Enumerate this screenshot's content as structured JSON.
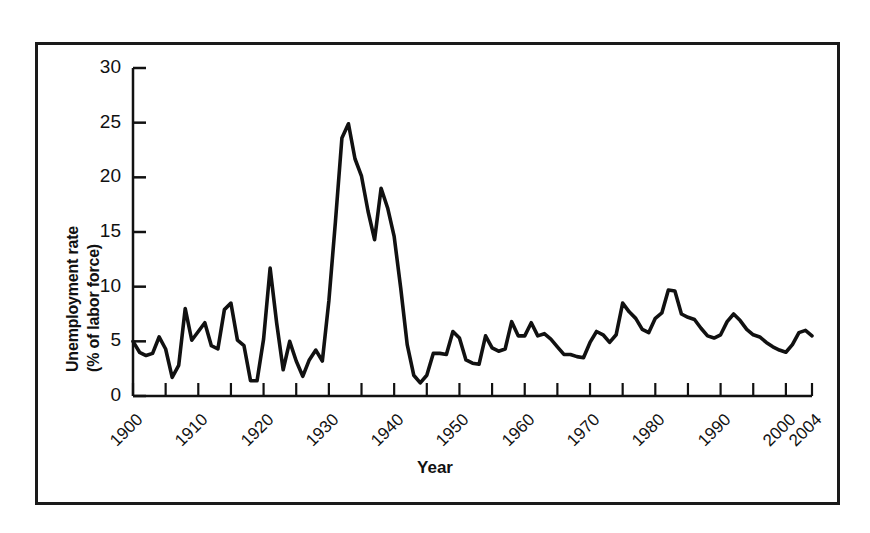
{
  "chart_data": {
    "type": "line",
    "title": "",
    "xlabel": "Year",
    "ylabel": "Unemployment rate (% of labor force)",
    "ylabel_line1": "Unemployment rate",
    "ylabel_line2": "(% of labor force)",
    "ylim": [
      0,
      30
    ],
    "xlim": [
      1900,
      2004
    ],
    "grid": false,
    "legend": "none",
    "ytick_labels": [
      "30",
      "25",
      "20",
      "15",
      "10",
      "5",
      "0"
    ],
    "ytick_values": [
      30,
      25,
      20,
      15,
      10,
      5,
      0
    ],
    "xtick_labels": [
      "1900",
      "1910",
      "1920",
      "1930",
      "1940",
      "1950",
      "1960",
      "1970",
      "1980",
      "1990",
      "2000",
      "2004"
    ],
    "xtick_values": [
      1900,
      1910,
      1920,
      1930,
      1940,
      1950,
      1960,
      1970,
      1980,
      1990,
      2000,
      2004
    ],
    "minor_xtick_interval": 5,
    "series": [
      {
        "name": "Unemployment rate",
        "color": "#111111",
        "x": [
          1900,
          1901,
          1902,
          1903,
          1904,
          1905,
          1906,
          1907,
          1908,
          1909,
          1910,
          1911,
          1912,
          1913,
          1914,
          1915,
          1916,
          1917,
          1918,
          1919,
          1920,
          1921,
          1922,
          1923,
          1924,
          1925,
          1926,
          1927,
          1928,
          1929,
          1930,
          1931,
          1932,
          1933,
          1934,
          1935,
          1936,
          1937,
          1938,
          1939,
          1940,
          1941,
          1942,
          1943,
          1944,
          1945,
          1946,
          1947,
          1948,
          1949,
          1950,
          1951,
          1952,
          1953,
          1954,
          1955,
          1956,
          1957,
          1958,
          1959,
          1960,
          1961,
          1962,
          1963,
          1964,
          1965,
          1966,
          1967,
          1968,
          1969,
          1970,
          1971,
          1972,
          1973,
          1974,
          1975,
          1976,
          1977,
          1978,
          1979,
          1980,
          1981,
          1982,
          1983,
          1984,
          1985,
          1986,
          1987,
          1988,
          1989,
          1990,
          1991,
          1992,
          1993,
          1994,
          1995,
          1996,
          1997,
          1998,
          1999,
          2000,
          2001,
          2002,
          2003,
          2004
        ],
        "values": [
          5.0,
          4.0,
          3.7,
          3.9,
          5.4,
          4.3,
          1.7,
          2.8,
          8.0,
          5.1,
          5.9,
          6.7,
          4.6,
          4.3,
          7.9,
          8.5,
          5.1,
          4.6,
          1.4,
          1.4,
          5.2,
          11.7,
          6.7,
          2.4,
          5.0,
          3.2,
          1.8,
          3.3,
          4.2,
          3.2,
          8.7,
          15.9,
          23.6,
          24.9,
          21.7,
          20.1,
          16.9,
          14.3,
          19.0,
          17.2,
          14.6,
          9.9,
          4.7,
          1.9,
          1.2,
          1.9,
          3.9,
          3.9,
          3.8,
          5.9,
          5.3,
          3.3,
          3.0,
          2.9,
          5.5,
          4.4,
          4.1,
          4.3,
          6.8,
          5.5,
          5.5,
          6.7,
          5.5,
          5.7,
          5.2,
          4.5,
          3.8,
          3.8,
          3.6,
          3.5,
          4.9,
          5.9,
          5.6,
          4.9,
          5.6,
          8.5,
          7.7,
          7.1,
          6.1,
          5.8,
          7.1,
          7.6,
          9.7,
          9.6,
          7.5,
          7.2,
          7.0,
          6.2,
          5.5,
          5.3,
          5.6,
          6.8,
          7.5,
          6.9,
          6.1,
          5.6,
          5.4,
          4.9,
          4.5,
          4.2,
          4.0,
          4.7,
          5.8,
          6.0,
          5.5
        ]
      }
    ]
  },
  "axis": {
    "x_title": "Year"
  }
}
